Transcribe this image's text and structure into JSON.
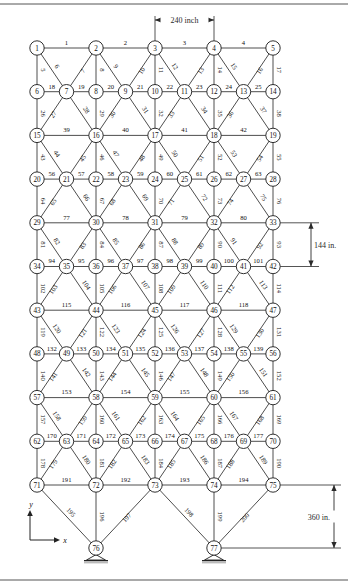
{
  "figure": {
    "type": "structural-truss-diagram",
    "title": "",
    "units": "inch",
    "node_count": 77,
    "member_count": 200,
    "support_nodes": [
      76,
      77
    ],
    "support_type": "pinned"
  },
  "dimensions": {
    "horizontal": {
      "label": "240 inch",
      "value": 240,
      "unit": "inch",
      "between_nodes": [
        3,
        4
      ]
    },
    "vertical_bay": {
      "label": "144 in.",
      "value": 144,
      "unit": "in.",
      "between_nodes": [
        33,
        42
      ]
    },
    "vertical_support": {
      "label": "360 in.",
      "value": 360,
      "unit": "in.",
      "between_nodes": [
        75,
        77
      ]
    }
  },
  "axes": {
    "x_label": "x",
    "y_label": "y"
  },
  "geometry": {
    "comment": "grid coordinates: col units of 30px, row units of 44px, origin x0=37 y0=48",
    "x0": 37,
    "y0": 48,
    "colw": 29.5,
    "rowh": 43.7,
    "rows": [
      {
        "row": 0,
        "type": "wide",
        "nodes": [
          1,
          2,
          3,
          4,
          5
        ],
        "cols": [
          0,
          2,
          4,
          6,
          8
        ]
      },
      {
        "row": 1,
        "type": "narrow",
        "nodes": [
          6,
          7,
          8,
          9,
          10,
          11,
          12,
          13,
          14
        ],
        "cols": [
          0,
          1,
          2,
          3,
          4,
          5,
          6,
          7,
          8
        ]
      },
      {
        "row": 2,
        "type": "wide",
        "nodes": [
          15,
          16,
          17,
          18,
          19
        ],
        "cols": [
          0,
          2,
          4,
          6,
          8
        ]
      },
      {
        "row": 3,
        "type": "narrow",
        "nodes": [
          20,
          21,
          22,
          23,
          24,
          25,
          26,
          27,
          28
        ],
        "cols": [
          0,
          1,
          2,
          3,
          4,
          5,
          6,
          7,
          8
        ]
      },
      {
        "row": 4,
        "type": "wide",
        "nodes": [
          29,
          30,
          31,
          32,
          33
        ],
        "cols": [
          0,
          2,
          4,
          6,
          8
        ]
      },
      {
        "row": 5,
        "type": "narrow",
        "nodes": [
          34,
          35,
          36,
          37,
          38,
          39,
          40,
          41,
          42
        ],
        "cols": [
          0,
          1,
          2,
          3,
          4,
          5,
          6,
          7,
          8
        ]
      },
      {
        "row": 6,
        "type": "wide",
        "nodes": [
          43,
          44,
          45,
          46,
          47
        ],
        "cols": [
          0,
          2,
          4,
          6,
          8
        ]
      },
      {
        "row": 7,
        "type": "narrow",
        "nodes": [
          48,
          49,
          50,
          51,
          52,
          53,
          54,
          55,
          56
        ],
        "cols": [
          0,
          1,
          2,
          3,
          4,
          5,
          6,
          7,
          8
        ]
      },
      {
        "row": 8,
        "type": "wide",
        "nodes": [
          57,
          58,
          59,
          60,
          61
        ],
        "cols": [
          0,
          2,
          4,
          6,
          8
        ]
      },
      {
        "row": 9,
        "type": "narrow",
        "nodes": [
          62,
          63,
          64,
          65,
          66,
          67,
          68,
          69,
          70
        ],
        "cols": [
          0,
          1,
          2,
          3,
          4,
          5,
          6,
          7,
          8
        ]
      },
      {
        "row": 10,
        "type": "wide",
        "nodes": [
          71,
          72,
          73,
          74,
          75
        ],
        "cols": [
          0,
          2,
          4,
          6,
          8
        ]
      }
    ],
    "supports": [
      {
        "node": 76,
        "col": 2,
        "y": 548
      },
      {
        "node": 77,
        "col": 6,
        "y": 548
      }
    ]
  },
  "members": [
    {
      "id": 1,
      "a": 1,
      "b": 2
    },
    {
      "id": 2,
      "a": 2,
      "b": 3
    },
    {
      "id": 3,
      "a": 3,
      "b": 4
    },
    {
      "id": 4,
      "a": 4,
      "b": 5
    },
    {
      "id": 5,
      "a": 1,
      "b": 6
    },
    {
      "id": 6,
      "a": 1,
      "b": 7
    },
    {
      "id": 7,
      "a": 2,
      "b": 7
    },
    {
      "id": 8,
      "a": 2,
      "b": 8
    },
    {
      "id": 9,
      "a": 2,
      "b": 9
    },
    {
      "id": 10,
      "a": 3,
      "b": 9
    },
    {
      "id": 11,
      "a": 3,
      "b": 10
    },
    {
      "id": 12,
      "a": 3,
      "b": 11
    },
    {
      "id": 13,
      "a": 4,
      "b": 11
    },
    {
      "id": 14,
      "a": 4,
      "b": 12
    },
    {
      "id": 15,
      "a": 4,
      "b": 13
    },
    {
      "id": 16,
      "a": 5,
      "b": 13
    },
    {
      "id": 17,
      "a": 5,
      "b": 14
    },
    {
      "id": 18,
      "a": 6,
      "b": 7
    },
    {
      "id": 19,
      "a": 7,
      "b": 8
    },
    {
      "id": 20,
      "a": 8,
      "b": 9
    },
    {
      "id": 21,
      "a": 9,
      "b": 10
    },
    {
      "id": 22,
      "a": 10,
      "b": 11
    },
    {
      "id": 23,
      "a": 11,
      "b": 12
    },
    {
      "id": 24,
      "a": 12,
      "b": 13
    },
    {
      "id": 25,
      "a": 13,
      "b": 14
    },
    {
      "id": 26,
      "a": 6,
      "b": 15
    },
    {
      "id": 27,
      "a": 7,
      "b": 15
    },
    {
      "id": 28,
      "a": 7,
      "b": 16
    },
    {
      "id": 29,
      "a": 8,
      "b": 16
    },
    {
      "id": 30,
      "a": 9,
      "b": 16
    },
    {
      "id": 31,
      "a": 9,
      "b": 17
    },
    {
      "id": 32,
      "a": 10,
      "b": 17
    },
    {
      "id": 33,
      "a": 11,
      "b": 17
    },
    {
      "id": 34,
      "a": 11,
      "b": 18
    },
    {
      "id": 35,
      "a": 12,
      "b": 18
    },
    {
      "id": 36,
      "a": 13,
      "b": 18
    },
    {
      "id": 37,
      "a": 13,
      "b": 19
    },
    {
      "id": 38,
      "a": 14,
      "b": 19
    },
    {
      "id": 39,
      "a": 15,
      "b": 16
    },
    {
      "id": 40,
      "a": 16,
      "b": 17
    },
    {
      "id": 41,
      "a": 17,
      "b": 18
    },
    {
      "id": 42,
      "a": 18,
      "b": 19
    },
    {
      "id": 43,
      "a": 15,
      "b": 20
    },
    {
      "id": 44,
      "a": 15,
      "b": 21
    },
    {
      "id": 45,
      "a": 16,
      "b": 21
    },
    {
      "id": 46,
      "a": 16,
      "b": 22
    },
    {
      "id": 47,
      "a": 16,
      "b": 23
    },
    {
      "id": 48,
      "a": 17,
      "b": 23
    },
    {
      "id": 49,
      "a": 17,
      "b": 24
    },
    {
      "id": 50,
      "a": 17,
      "b": 25
    },
    {
      "id": 51,
      "a": 18,
      "b": 25
    },
    {
      "id": 52,
      "a": 18,
      "b": 26
    },
    {
      "id": 53,
      "a": 18,
      "b": 27
    },
    {
      "id": 54,
      "a": 19,
      "b": 27
    },
    {
      "id": 55,
      "a": 19,
      "b": 28
    },
    {
      "id": 56,
      "a": 20,
      "b": 21
    },
    {
      "id": 57,
      "a": 21,
      "b": 22
    },
    {
      "id": 58,
      "a": 22,
      "b": 23
    },
    {
      "id": 59,
      "a": 23,
      "b": 24
    },
    {
      "id": 60,
      "a": 24,
      "b": 25
    },
    {
      "id": 61,
      "a": 25,
      "b": 26
    },
    {
      "id": 62,
      "a": 26,
      "b": 27
    },
    {
      "id": 63,
      "a": 27,
      "b": 28
    },
    {
      "id": 64,
      "a": 20,
      "b": 29
    },
    {
      "id": 65,
      "a": 21,
      "b": 29
    },
    {
      "id": 66,
      "a": 21,
      "b": 30
    },
    {
      "id": 67,
      "a": 22,
      "b": 30
    },
    {
      "id": 68,
      "a": 23,
      "b": 30
    },
    {
      "id": 69,
      "a": 23,
      "b": 31
    },
    {
      "id": 70,
      "a": 24,
      "b": 31
    },
    {
      "id": 71,
      "a": 25,
      "b": 31
    },
    {
      "id": 72,
      "a": 25,
      "b": 32
    },
    {
      "id": 73,
      "a": 26,
      "b": 32
    },
    {
      "id": 74,
      "a": 27,
      "b": 32
    },
    {
      "id": 75,
      "a": 27,
      "b": 33
    },
    {
      "id": 76,
      "a": 28,
      "b": 33
    },
    {
      "id": 77,
      "a": 29,
      "b": 30
    },
    {
      "id": 78,
      "a": 30,
      "b": 31
    },
    {
      "id": 79,
      "a": 31,
      "b": 32
    },
    {
      "id": 80,
      "a": 32,
      "b": 33
    },
    {
      "id": 81,
      "a": 29,
      "b": 34
    },
    {
      "id": 82,
      "a": 29,
      "b": 35
    },
    {
      "id": 83,
      "a": 30,
      "b": 35
    },
    {
      "id": 84,
      "a": 30,
      "b": 36
    },
    {
      "id": 85,
      "a": 30,
      "b": 37
    },
    {
      "id": 86,
      "a": 31,
      "b": 37
    },
    {
      "id": 87,
      "a": 31,
      "b": 38
    },
    {
      "id": 88,
      "a": 31,
      "b": 39
    },
    {
      "id": 89,
      "a": 32,
      "b": 39
    },
    {
      "id": 90,
      "a": 32,
      "b": 40
    },
    {
      "id": 91,
      "a": 32,
      "b": 41
    },
    {
      "id": 92,
      "a": 33,
      "b": 41
    },
    {
      "id": 93,
      "a": 33,
      "b": 42
    },
    {
      "id": 94,
      "a": 34,
      "b": 35
    },
    {
      "id": 95,
      "a": 35,
      "b": 36
    },
    {
      "id": 96,
      "a": 36,
      "b": 37
    },
    {
      "id": 97,
      "a": 37,
      "b": 38
    },
    {
      "id": 98,
      "a": 38,
      "b": 39
    },
    {
      "id": 99,
      "a": 39,
      "b": 40
    },
    {
      "id": 100,
      "a": 40,
      "b": 41
    },
    {
      "id": 101,
      "a": 41,
      "b": 42
    },
    {
      "id": 102,
      "a": 34,
      "b": 43
    },
    {
      "id": 103,
      "a": 35,
      "b": 43
    },
    {
      "id": 104,
      "a": 35,
      "b": 44
    },
    {
      "id": 105,
      "a": 36,
      "b": 44
    },
    {
      "id": 106,
      "a": 37,
      "b": 44
    },
    {
      "id": 107,
      "a": 37,
      "b": 45
    },
    {
      "id": 108,
      "a": 38,
      "b": 45
    },
    {
      "id": 109,
      "a": 39,
      "b": 45
    },
    {
      "id": 110,
      "a": 39,
      "b": 46
    },
    {
      "id": 111,
      "a": 40,
      "b": 46
    },
    {
      "id": 112,
      "a": 41,
      "b": 46
    },
    {
      "id": 113,
      "a": 41,
      "b": 47
    },
    {
      "id": 114,
      "a": 42,
      "b": 47
    },
    {
      "id": 115,
      "a": 43,
      "b": 44
    },
    {
      "id": 116,
      "a": 44,
      "b": 45
    },
    {
      "id": 117,
      "a": 45,
      "b": 46
    },
    {
      "id": 118,
      "a": 46,
      "b": 47
    },
    {
      "id": 119,
      "a": 43,
      "b": 48
    },
    {
      "id": 120,
      "a": 43,
      "b": 49
    },
    {
      "id": 121,
      "a": 44,
      "b": 49
    },
    {
      "id": 122,
      "a": 44,
      "b": 50
    },
    {
      "id": 123,
      "a": 44,
      "b": 51
    },
    {
      "id": 124,
      "a": 45,
      "b": 51
    },
    {
      "id": 125,
      "a": 45,
      "b": 52
    },
    {
      "id": 126,
      "a": 45,
      "b": 53
    },
    {
      "id": 127,
      "a": 46,
      "b": 53
    },
    {
      "id": 128,
      "a": 46,
      "b": 54
    },
    {
      "id": 129,
      "a": 46,
      "b": 55
    },
    {
      "id": 130,
      "a": 47,
      "b": 55
    },
    {
      "id": 131,
      "a": 47,
      "b": 56
    },
    {
      "id": 132,
      "a": 48,
      "b": 49
    },
    {
      "id": 133,
      "a": 49,
      "b": 50
    },
    {
      "id": 134,
      "a": 50,
      "b": 51
    },
    {
      "id": 135,
      "a": 51,
      "b": 52
    },
    {
      "id": 136,
      "a": 52,
      "b": 53
    },
    {
      "id": 137,
      "a": 53,
      "b": 54
    },
    {
      "id": 138,
      "a": 54,
      "b": 55
    },
    {
      "id": 139,
      "a": 55,
      "b": 56
    },
    {
      "id": 140,
      "a": 48,
      "b": 57
    },
    {
      "id": 141,
      "a": 49,
      "b": 57
    },
    {
      "id": 142,
      "a": 49,
      "b": 58
    },
    {
      "id": 143,
      "a": 50,
      "b": 58
    },
    {
      "id": 144,
      "a": 51,
      "b": 58
    },
    {
      "id": 145,
      "a": 51,
      "b": 59
    },
    {
      "id": 146,
      "a": 52,
      "b": 59
    },
    {
      "id": 147,
      "a": 53,
      "b": 59
    },
    {
      "id": 148,
      "a": 53,
      "b": 60
    },
    {
      "id": 149,
      "a": 54,
      "b": 60
    },
    {
      "id": 150,
      "a": 55,
      "b": 60
    },
    {
      "id": 151,
      "a": 55,
      "b": 61
    },
    {
      "id": 152,
      "a": 56,
      "b": 61
    },
    {
      "id": 153,
      "a": 57,
      "b": 58
    },
    {
      "id": 154,
      "a": 58,
      "b": 59
    },
    {
      "id": 155,
      "a": 59,
      "b": 60
    },
    {
      "id": 156,
      "a": 60,
      "b": 61
    },
    {
      "id": 157,
      "a": 57,
      "b": 62
    },
    {
      "id": 158,
      "a": 57,
      "b": 63
    },
    {
      "id": 159,
      "a": 58,
      "b": 63
    },
    {
      "id": 160,
      "a": 58,
      "b": 64
    },
    {
      "id": 161,
      "a": 58,
      "b": 65
    },
    {
      "id": 162,
      "a": 59,
      "b": 65
    },
    {
      "id": 163,
      "a": 59,
      "b": 66
    },
    {
      "id": 164,
      "a": 59,
      "b": 67
    },
    {
      "id": 165,
      "a": 60,
      "b": 67
    },
    {
      "id": 166,
      "a": 60,
      "b": 68
    },
    {
      "id": 167,
      "a": 60,
      "b": 69
    },
    {
      "id": 168,
      "a": 61,
      "b": 69
    },
    {
      "id": 169,
      "a": 61,
      "b": 70
    },
    {
      "id": 170,
      "a": 62,
      "b": 63
    },
    {
      "id": 171,
      "a": 63,
      "b": 64
    },
    {
      "id": 172,
      "a": 64,
      "b": 65
    },
    {
      "id": 173,
      "a": 65,
      "b": 66
    },
    {
      "id": 174,
      "a": 66,
      "b": 67
    },
    {
      "id": 175,
      "a": 67,
      "b": 68
    },
    {
      "id": 176,
      "a": 68,
      "b": 69
    },
    {
      "id": 177,
      "a": 69,
      "b": 70
    },
    {
      "id": 178,
      "a": 62,
      "b": 71
    },
    {
      "id": 179,
      "a": 63,
      "b": 71
    },
    {
      "id": 180,
      "a": 63,
      "b": 72
    },
    {
      "id": 181,
      "a": 64,
      "b": 72
    },
    {
      "id": 182,
      "a": 65,
      "b": 72
    },
    {
      "id": 183,
      "a": 65,
      "b": 73
    },
    {
      "id": 184,
      "a": 66,
      "b": 73
    },
    {
      "id": 185,
      "a": 67,
      "b": 73
    },
    {
      "id": 186,
      "a": 67,
      "b": 74
    },
    {
      "id": 187,
      "a": 68,
      "b": 74
    },
    {
      "id": 188,
      "a": 69,
      "b": 74
    },
    {
      "id": 189,
      "a": 69,
      "b": 75
    },
    {
      "id": 190,
      "a": 70,
      "b": 75
    },
    {
      "id": 191,
      "a": 71,
      "b": 72
    },
    {
      "id": 192,
      "a": 72,
      "b": 73
    },
    {
      "id": 193,
      "a": 73,
      "b": 74
    },
    {
      "id": 194,
      "a": 74,
      "b": 75
    },
    {
      "id": 195,
      "a": 71,
      "b": 76
    },
    {
      "id": 196,
      "a": 72,
      "b": 76
    },
    {
      "id": 197,
      "a": 73,
      "b": 76
    },
    {
      "id": 198,
      "a": 73,
      "b": 77
    },
    {
      "id": 199,
      "a": 74,
      "b": 77
    },
    {
      "id": 200,
      "a": 75,
      "b": 77
    }
  ],
  "style": {
    "member_color": "#3a3a3a",
    "node_fill": "#ffffff",
    "node_stroke": "#1a1a1a",
    "label_color": "#111111",
    "dimension_color": "#2a2a2a",
    "border_color": "#666666"
  }
}
